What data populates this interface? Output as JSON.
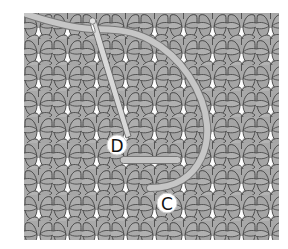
{
  "figure": {
    "type": "knitting-stitch-illustration",
    "panel": {
      "x": 24,
      "y": 13,
      "width": 255,
      "height": 227
    },
    "stitch_repeat": {
      "width": 29,
      "height": 26
    },
    "colors": {
      "background": "#ffffff",
      "fabric_fill": "#a8a8a8",
      "fabric_outline": "#3a3a3a",
      "gap_fill": "#ffffff",
      "yarn_fill": "#c4c4c4",
      "yarn_outline": "#7a7a7a",
      "needle_fill": "#d6d6d6",
      "label_bg": "#ffffff",
      "label_text": "#111111"
    },
    "labels": [
      {
        "id": "D",
        "text": "D",
        "x": 117,
        "y": 145
      },
      {
        "id": "C",
        "text": "C",
        "x": 167,
        "y": 203
      }
    ],
    "needle": {
      "x1": 92,
      "y1": 22,
      "x2": 128,
      "y2": 136
    },
    "yarn_bar": {
      "x1": 121,
      "y1": 160,
      "x2": 180,
      "y2": 160
    }
  }
}
